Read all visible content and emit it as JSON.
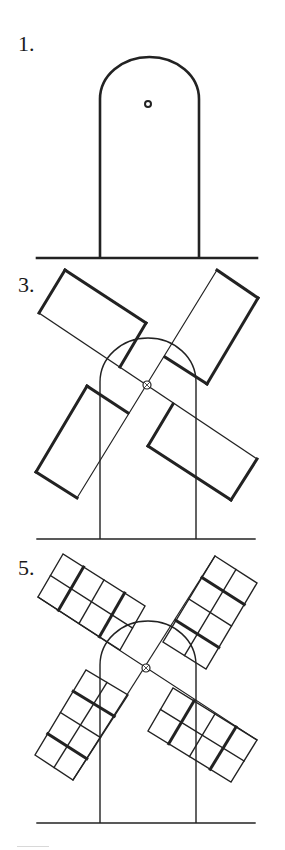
{
  "colors": {
    "ink": "#222222",
    "background": "#ffffff",
    "footer_rule": "#d8d8d8"
  },
  "steps": [
    {
      "label": "1.",
      "label_pos": [
        18,
        33
      ],
      "ground": {
        "x1": 37,
        "x2": 257,
        "y": 258,
        "stroke": 2.6
      },
      "tower": {
        "x_left": 100,
        "x_right": 199,
        "arch_top": 57,
        "arch_height": 42,
        "bottom": 258,
        "stroke": 2.6
      },
      "hub": {
        "cx": 148,
        "cy": 104,
        "r": 3,
        "stroke": 2,
        "cross": false
      },
      "stocks": [],
      "blades": []
    },
    {
      "label": "3.",
      "label_pos": [
        18,
        274
      ],
      "ground": {
        "x1": 37,
        "x2": 255,
        "y": 539,
        "stroke": 1.4
      },
      "tower": {
        "x_left": 100,
        "x_right": 196,
        "arch_top": 338,
        "arch_height": 44,
        "bottom": 539,
        "stroke": 1.4
      },
      "hub": {
        "cx": 147,
        "cy": 385,
        "r": 4,
        "stroke": 1.2,
        "cross": true
      },
      "stocks": [
        [
          [
            39,
            313
          ],
          [
            257,
            459
          ]
        ],
        [
          [
            77,
            498
          ],
          [
            217,
            270
          ]
        ]
      ],
      "blade_style": {
        "outline": 3,
        "grid": false
      },
      "blades": [
        {
          "name": "top-left",
          "outer": [
            [
              65,
              270
            ],
            [
              39,
              313
            ]
          ],
          "inner": [
            [
              146,
              323
            ],
            [
              120,
              367
            ]
          ]
        },
        {
          "name": "top-right",
          "outer": [
            [
              217,
              270
            ],
            [
              258,
              298
            ]
          ],
          "inner": [
            [
              165,
              357
            ],
            [
              207,
              384
            ]
          ]
        },
        {
          "name": "bottom-left",
          "outer": [
            [
              36,
              472
            ],
            [
              77,
              498
            ]
          ],
          "inner": [
            [
              87,
              386
            ],
            [
              128,
              413
            ]
          ]
        },
        {
          "name": "bottom-right",
          "outer": [
            [
              257,
              459
            ],
            [
              231,
              500
            ]
          ],
          "inner": [
            [
              173,
              404
            ],
            [
              148,
              446
            ]
          ]
        }
      ]
    },
    {
      "label": "5.",
      "label_pos": [
        18,
        557
      ],
      "ground": {
        "x1": 37,
        "x2": 255,
        "y": 823,
        "stroke": 1.4
      },
      "tower": {
        "x_left": 100,
        "x_right": 196,
        "arch_top": 621,
        "arch_height": 44,
        "bottom": 823,
        "stroke": 1.4
      },
      "hub": {
        "cx": 146,
        "cy": 668,
        "r": 4,
        "stroke": 1.2,
        "cross": true
      },
      "stocks": [
        [
          [
            38,
            597
          ],
          [
            257,
            740
          ]
        ],
        [
          [
            73,
            780
          ],
          [
            215,
            556
          ]
        ]
      ],
      "blade_style": {
        "outline": 1.4,
        "grid": true,
        "rows": 4,
        "cols": 2,
        "thick_rows": [
          1,
          3
        ],
        "thick_stroke": 3
      },
      "blades": [
        {
          "name": "top-left",
          "outer": [
            [
              63,
              554
            ],
            [
              38,
              597
            ]
          ],
          "inner": [
            [
              145,
              606
            ],
            [
              120,
              650
            ]
          ]
        },
        {
          "name": "top-right",
          "outer": [
            [
              215,
              556
            ],
            [
              257,
              583
            ]
          ],
          "inner": [
            [
              163,
              642
            ],
            [
              206,
              669
            ]
          ]
        },
        {
          "name": "bottom-left",
          "outer": [
            [
              35,
              755
            ],
            [
              73,
              780
            ]
          ],
          "inner": [
            [
              86,
              670
            ],
            [
              128,
              695
            ]
          ]
        },
        {
          "name": "bottom-right",
          "outer": [
            [
              257,
              740
            ],
            [
              231,
              782
            ]
          ],
          "inner": [
            [
              173,
              688
            ],
            [
              148,
              731
            ]
          ]
        }
      ]
    }
  ]
}
